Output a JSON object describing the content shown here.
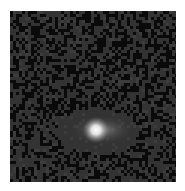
{
  "image": {
    "subject": "galaxy cutout with pixel noise",
    "frame": {
      "x": 10,
      "y": 11,
      "width": 166,
      "height": 171
    },
    "background_color": "#333333",
    "noise": {
      "block_size": 3,
      "dark_color": "#0a0a0a",
      "dark_fraction": 0.42,
      "seed": 7
    },
    "galaxy": {
      "center_x": 86,
      "center_y": 119,
      "core_radius": 6,
      "halo_radius_x": 30,
      "halo_radius_y": 14,
      "core_color": "#ffffff"
    }
  }
}
